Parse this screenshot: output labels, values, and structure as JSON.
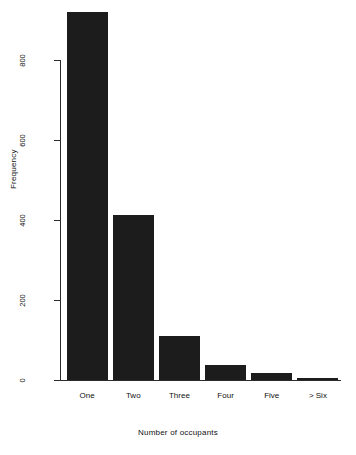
{
  "chart_data": {
    "type": "bar",
    "title": "",
    "subtitle": "",
    "xlabel": "Number of occupants",
    "ylabel": "Frequency",
    "categories": [
      "One",
      "Two",
      "Three",
      "Four",
      "Five",
      "> Six"
    ],
    "values": [
      920,
      412,
      110,
      38,
      18,
      5
    ],
    "series": [
      {
        "name": "Frequency",
        "values": [
          920,
          412,
          110,
          38,
          18,
          5
        ]
      }
    ],
    "ylim": [
      0,
      920
    ],
    "yticks": [
      0,
      200,
      400,
      600,
      800
    ],
    "ytick_labels": [
      "0",
      "200",
      "400",
      "600",
      "800"
    ],
    "xlim": [
      0,
      6
    ],
    "grid": false,
    "legend": false,
    "legend_position": "none",
    "bar_color": "#1c1c1c",
    "background_color": "#ffffff",
    "axis_color": "#2b2b2b",
    "orientation": "vertical",
    "axis_label_rotation_y": 90
  }
}
